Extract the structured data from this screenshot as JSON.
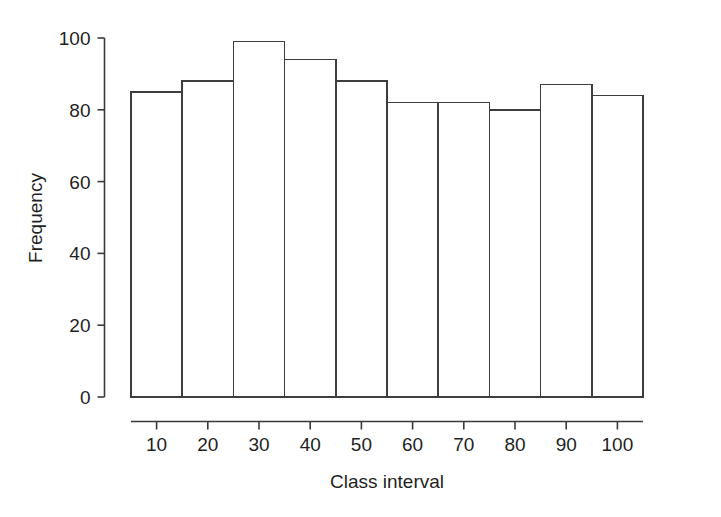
{
  "chart_data": {
    "type": "bar",
    "title": "",
    "subtitle": "",
    "xlabel": "Class interval",
    "ylabel": "Frequency",
    "categories": [
      "10",
      "20",
      "30",
      "40",
      "50",
      "60",
      "70",
      "80",
      "90",
      "100"
    ],
    "values": [
      85,
      88,
      99,
      94,
      88,
      82,
      82,
      80,
      87,
      84
    ],
    "series": [
      {
        "name": "Frequency",
        "values": [
          85,
          88,
          99,
          94,
          88,
          82,
          82,
          80,
          87,
          84
        ]
      }
    ],
    "ylim": [
      0,
      100
    ],
    "yticks": [
      0,
      20,
      40,
      60,
      80,
      100
    ],
    "ytick_labels": [
      "0",
      "20",
      "40",
      "60",
      "80",
      "100"
    ],
    "xtick_labels": [
      "10",
      "20",
      "30",
      "40",
      "50",
      "60",
      "70",
      "80",
      "90",
      "100"
    ],
    "grid": false,
    "legend": false,
    "legend_position": "none",
    "bar_style": {
      "fill_color": "#ffffff",
      "edge_color": "#3d3d3d",
      "gap": 0,
      "note": "histogram - adjacent bars, no spacing"
    },
    "axis_style": {
      "line_color": "#3a3a3a",
      "tick_direction": "outward",
      "spines": [
        "left",
        "bottom"
      ],
      "detached_axes": true
    },
    "background_color": "#ffffff"
  },
  "figure": {
    "name": "histogram-figure",
    "width": 721,
    "height": 517
  }
}
